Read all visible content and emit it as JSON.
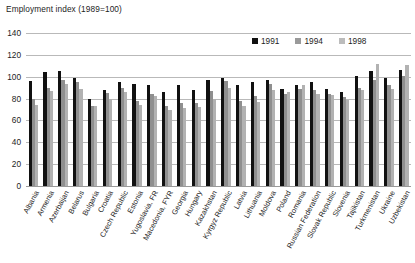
{
  "chart_data": {
    "type": "bar",
    "title": "Employment index (1989=100)",
    "xlabel": "",
    "ylabel": "",
    "ylim": [
      0,
      140
    ],
    "yticks": [
      0,
      20,
      40,
      60,
      80,
      100,
      120,
      140
    ],
    "grid": true,
    "legend_position": "top-right",
    "categories": [
      "Albania",
      "Armenia",
      "Azerbaijan",
      "Belarus",
      "Bulgaria",
      "Croatia",
      "Czech Republic",
      "Estonia",
      "Yugoslavia, FR",
      "Macedonia, FYR",
      "Georgia",
      "Hungary",
      "Kazakhstan",
      "Kyrgyz Republic",
      "Latvia",
      "Lithuania",
      "Moldova",
      "Poland",
      "Romania",
      "Russian Federation",
      "Slovak Republic",
      "Slovenia",
      "Tajikistan",
      "Turkmenistan",
      "Ukraine",
      "Uzbekistan"
    ],
    "series": [
      {
        "name": "1991",
        "color": "#111111",
        "values": [
          96,
          104,
          105,
          99,
          80,
          88,
          95,
          93,
          92,
          86,
          92,
          88,
          97,
          99,
          92,
          95,
          97,
          89,
          92,
          95,
          89,
          86,
          101,
          105,
          99,
          106
        ]
      },
      {
        "name": "1994",
        "color": "#8f8f8f",
        "values": [
          80,
          90,
          97,
          95,
          73,
          85,
          90,
          78,
          84,
          73,
          76,
          76,
          87,
          96,
          78,
          82,
          93,
          84,
          89,
          88,
          84,
          81,
          90,
          97,
          92,
          101
        ]
      },
      {
        "name": "1998",
        "color": "#b2b2b2",
        "values": [
          74,
          87,
          93,
          89,
          73,
          80,
          86,
          74,
          82,
          70,
          71,
          72,
          80,
          90,
          73,
          77,
          88,
          86,
          92,
          84,
          83,
          79,
          88,
          112,
          89,
          111
        ]
      }
    ]
  },
  "legend": {
    "items": [
      {
        "label": "1991"
      },
      {
        "label": "1994"
      },
      {
        "label": "1998"
      }
    ]
  }
}
